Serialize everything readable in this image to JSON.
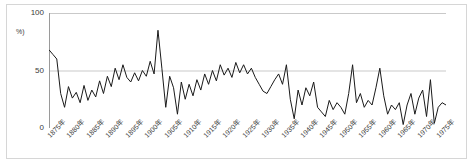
{
  "figure": {
    "ylabel": "%)",
    "background_color": "#ffffff",
    "frame_color": "#d6d6d6",
    "line_color": "#1a1a1a",
    "grid_color": "#c9c9c9",
    "text_color": "#3a3a3a"
  },
  "chart_data": {
    "type": "line",
    "title": "",
    "xlabel": "",
    "ylabel": "%)",
    "ylim": [
      0,
      100
    ],
    "xlim": [
      1875,
      1977
    ],
    "yticks": [
      0,
      50,
      100
    ],
    "ytick_labels": [
      "0",
      "50",
      "100"
    ],
    "grid": true,
    "grid_axis": "y",
    "legend": false,
    "xtick_labels": [
      "1875年",
      "1880年",
      "1885年",
      "1890年",
      "1895年",
      "1900年",
      "1905年",
      "1910年",
      "1915年",
      "1920年",
      "1925年",
      "1930年",
      "1935年",
      "1940年",
      "1945年",
      "1950年",
      "1955年",
      "1960年",
      "1965年",
      "1970年",
      "1975年"
    ],
    "xtick_values": [
      1875,
      1880,
      1885,
      1890,
      1895,
      1900,
      1905,
      1910,
      1915,
      1920,
      1925,
      1930,
      1935,
      1940,
      1945,
      1950,
      1955,
      1960,
      1965,
      1970,
      1975
    ],
    "minor_tick_interval": 1,
    "x": [
      1875,
      1876,
      1877,
      1878,
      1879,
      1880,
      1881,
      1882,
      1883,
      1884,
      1885,
      1886,
      1887,
      1888,
      1889,
      1890,
      1891,
      1892,
      1893,
      1894,
      1895,
      1896,
      1897,
      1898,
      1899,
      1900,
      1901,
      1902,
      1903,
      1904,
      1905,
      1906,
      1907,
      1908,
      1909,
      1910,
      1911,
      1912,
      1913,
      1914,
      1915,
      1916,
      1917,
      1918,
      1919,
      1920,
      1921,
      1922,
      1923,
      1924,
      1925,
      1926,
      1927,
      1928,
      1929,
      1930,
      1931,
      1932,
      1933,
      1934,
      1935,
      1936,
      1937,
      1938,
      1939,
      1940,
      1941,
      1942,
      1943,
      1944,
      1945,
      1946,
      1947,
      1948,
      1949,
      1950,
      1951,
      1952,
      1953,
      1954,
      1955,
      1956,
      1957,
      1958,
      1959,
      1960,
      1961,
      1962,
      1963,
      1964,
      1965,
      1966,
      1967,
      1968,
      1969,
      1970,
      1971,
      1972,
      1973,
      1974,
      1975,
      1976,
      1977
    ],
    "values": [
      68,
      64,
      60,
      30,
      18,
      36,
      26,
      31,
      22,
      37,
      24,
      33,
      27,
      41,
      30,
      45,
      36,
      52,
      42,
      55,
      44,
      40,
      48,
      41,
      50,
      45,
      58,
      47,
      85,
      52,
      18,
      45,
      35,
      12,
      40,
      25,
      38,
      28,
      42,
      33,
      47,
      38,
      50,
      41,
      55,
      46,
      52,
      44,
      57,
      48,
      55,
      47,
      52,
      44,
      38,
      32,
      30,
      36,
      42,
      47,
      38,
      55,
      25,
      8,
      33,
      20,
      35,
      28,
      40,
      18,
      14,
      10,
      24,
      16,
      22,
      18,
      12,
      30,
      55,
      22,
      30,
      18,
      24,
      20,
      35,
      52,
      28,
      12,
      20,
      16,
      22,
      3,
      20,
      30,
      12,
      26,
      33,
      10,
      42,
      4,
      18,
      22,
      20
    ],
    "series_name": ""
  }
}
